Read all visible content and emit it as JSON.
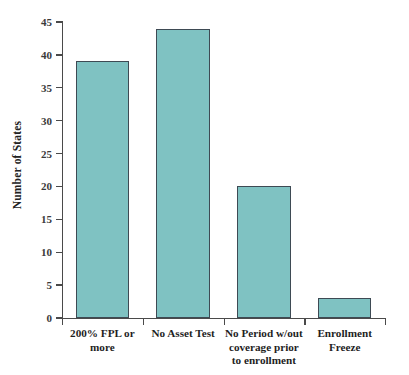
{
  "chart_data": {
    "type": "bar",
    "title": "",
    "subtitle": "",
    "xlabel": "",
    "ylabel": "Number of States",
    "categories": [
      "200% FPL or more",
      "No Asset Test",
      "No Period w/out coverage prior to enrollment",
      "Enrollment Freeze"
    ],
    "values": [
      39,
      44,
      20,
      3
    ],
    "ylim": [
      0,
      45
    ],
    "yticks": [
      0,
      5,
      10,
      15,
      20,
      25,
      30,
      35,
      40,
      45
    ],
    "ytick_labels": [
      "0",
      "5",
      "10",
      "15",
      "20",
      "25",
      "30",
      "35",
      "40",
      "45"
    ],
    "grid": false,
    "legend": null,
    "legend_position": "none",
    "bar_color": "#7fc2c2",
    "bar_edge_color": "#3e4a54",
    "axis_color": "#4a4a4a",
    "background_color": "#ffffff"
  },
  "axes": {
    "y_title": "Number of States",
    "y_tick_labels": [
      "45",
      "40",
      "35",
      "30",
      "25",
      "20",
      "15",
      "10",
      "5",
      "0"
    ]
  },
  "categories": [
    {
      "lines": [
        "200% FPL or",
        "more"
      ],
      "value": 39
    },
    {
      "lines": [
        "No Asset Test"
      ],
      "value": 44
    },
    {
      "lines": [
        "No Period w/out",
        "coverage prior",
        "to enrollment"
      ],
      "value": 20
    },
    {
      "lines": [
        "Enrollment",
        "Freeze"
      ],
      "value": 3
    }
  ]
}
